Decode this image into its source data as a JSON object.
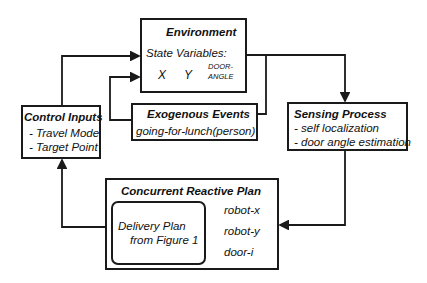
{
  "environment": {
    "title": "Environment",
    "state_label": "State Variables:",
    "vars": [
      "X",
      "Y",
      "DOOR-",
      "ANGLE"
    ]
  },
  "exogenous": {
    "title": "Exogenous Events",
    "event": "going-for-lunch(person)"
  },
  "control": {
    "title": "Control Inputs",
    "items": [
      "- Travel Mode",
      "- Target Point"
    ]
  },
  "sensing": {
    "title": "Sensing Process",
    "items": [
      "- self localization",
      "- door angle estimation"
    ]
  },
  "plan": {
    "title": "Concurrent Reactive Plan",
    "inner_lines": [
      "Delivery Plan",
      "from Figure 1"
    ],
    "vars": [
      "robot-x",
      "robot-y",
      "door-i"
    ]
  }
}
